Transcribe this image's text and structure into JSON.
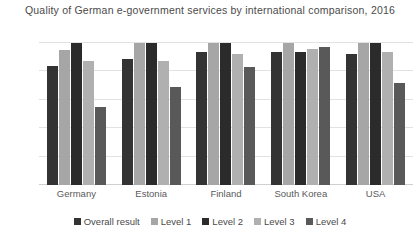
{
  "chart_data": {
    "type": "bar",
    "title": "Quality of German e-government services by international comparison, 2016",
    "xlabel": "",
    "ylabel": "",
    "ylim": [
      0,
      100
    ],
    "grid": true,
    "legend_position": "bottom",
    "categories": [
      "Germany",
      "Estonia",
      "Finland",
      "South Korea",
      "USA"
    ],
    "ytick_labels": [
      "0%",
      "20%",
      "40%",
      "60%",
      "80%",
      "00%"
    ],
    "ytick_values": [
      0,
      20,
      40,
      60,
      80,
      100
    ],
    "series": [
      {
        "name": "Overall result",
        "color": "#333333",
        "values": [
          84,
          89,
          94,
          94,
          92
        ]
      },
      {
        "name": "Level 1",
        "color": "#a6a6a6",
        "values": [
          95,
          100,
          100,
          100,
          100
        ]
      },
      {
        "name": "Level 2",
        "color": "#2b2b2b",
        "values": [
          100,
          100,
          100,
          94,
          100
        ]
      },
      {
        "name": "Level 3",
        "color": "#b0b0b0",
        "values": [
          87,
          87,
          92,
          96,
          94
        ]
      },
      {
        "name": "Level 4",
        "color": "#595959",
        "values": [
          55,
          69,
          83,
          97,
          72
        ]
      }
    ]
  }
}
